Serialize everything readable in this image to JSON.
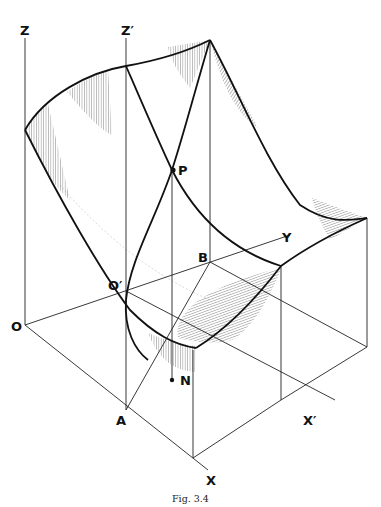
{
  "figure": {
    "caption": "Fig. 3.4",
    "labels": {
      "Z": "Z",
      "Zp": "Z′",
      "O": "O",
      "Op": "O′",
      "A": "A",
      "B": "B",
      "X": "X",
      "Xp": "X′",
      "Y": "Y",
      "P": "P",
      "N": "N"
    },
    "colors": {
      "ink": "#111111",
      "background": "#ffffff",
      "hatch": "#555555"
    }
  }
}
